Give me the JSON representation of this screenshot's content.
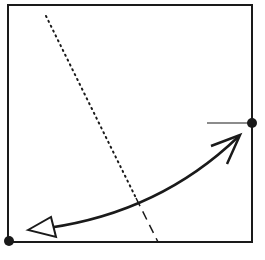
{
  "diagram": {
    "colors": {
      "stroke": "#1a1a1a",
      "background": "#ffffff"
    },
    "square": {
      "x": 8,
      "y": 5,
      "width": 244,
      "height": 237
    },
    "points": [
      {
        "name": "bottom-left-dot",
        "x": 9,
        "y": 241,
        "r": 5
      },
      {
        "name": "right-dot",
        "x": 252,
        "y": 123,
        "r": 5
      }
    ],
    "reference_line": {
      "x1": 207,
      "y1": 123,
      "x2": 252,
      "y2": 123
    },
    "dotted_line": {
      "x1": 46,
      "y1": 16,
      "x2": 136,
      "y2": 198
    },
    "dashed_line": {
      "x1": 136,
      "y1": 198,
      "x2": 158,
      "y2": 242
    },
    "curved_arrow": {
      "path": "M 48 228 Q 160 212 238 137",
      "open_head": {
        "tip": [
          240,
          135
        ],
        "wing1": [
          211,
          146
        ],
        "wing2": [
          227,
          164
        ]
      },
      "hollow_head": {
        "tip": [
          28,
          230
        ],
        "v2": [
          51,
          217
        ],
        "v3": [
          56,
          237
        ]
      }
    }
  }
}
